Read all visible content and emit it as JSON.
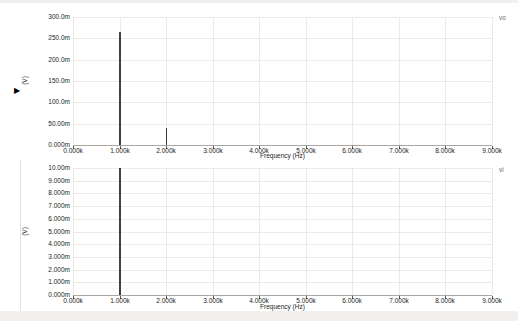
{
  "ui": {
    "active_trace_marker": "▶"
  },
  "colors": {
    "background": "#ffffff",
    "grid": "#ebe8e6",
    "axis": "#a9a6a3",
    "tick": "#5a5a5a",
    "spike": "#3f3f3f",
    "text": "#1c1c1c",
    "trace_label": "#6a6a6a",
    "edge_strip": "#f1f0ee",
    "page_border": "#e3e1df"
  },
  "chart_data": [
    {
      "type": "bar",
      "subtype": "frequency-spectrum-stems",
      "trace_label": "vo",
      "xlabel": "Frequency (Hz)",
      "ylabel": "(V)",
      "xlim_khz": [
        0,
        9
      ],
      "ylim_mv": [
        0,
        300
      ],
      "grid": true,
      "legend_position": "top-right",
      "x_ticks": [
        "0.000k",
        "1.000k",
        "2.000k",
        "3.000k",
        "4.000k",
        "5.000k",
        "6.000k",
        "7.000k",
        "8.000k",
        "9.000k"
      ],
      "y_ticks": [
        "300.0m",
        "250.0m",
        "200.0m",
        "150.0m",
        "100.0m",
        "50.00m",
        "0.000m"
      ],
      "points": [
        {
          "x_khz": 1.0,
          "y_mv": 265
        },
        {
          "x_khz": 2.0,
          "y_mv": 40
        }
      ]
    },
    {
      "type": "bar",
      "subtype": "frequency-spectrum-stems",
      "trace_label": "vi",
      "xlabel": "Frequency (Hz)",
      "ylabel": "(V)",
      "xlim_khz": [
        0,
        9
      ],
      "ylim_mv": [
        0,
        10
      ],
      "grid": true,
      "legend_position": "top-right",
      "x_ticks": [
        "0.000k",
        "1.000k",
        "2.000k",
        "3.000k",
        "4.000k",
        "5.000k",
        "6.000k",
        "7.000k",
        "8.000k",
        "9.000k"
      ],
      "y_ticks": [
        "10.00m",
        "9.000m",
        "8.000m",
        "7.000m",
        "6.000m",
        "5.000m",
        "4.000m",
        "3.000m",
        "2.000m",
        "1.000m",
        "0.000m"
      ],
      "points": [
        {
          "x_khz": 1.0,
          "y_mv": 10.0
        }
      ]
    }
  ]
}
